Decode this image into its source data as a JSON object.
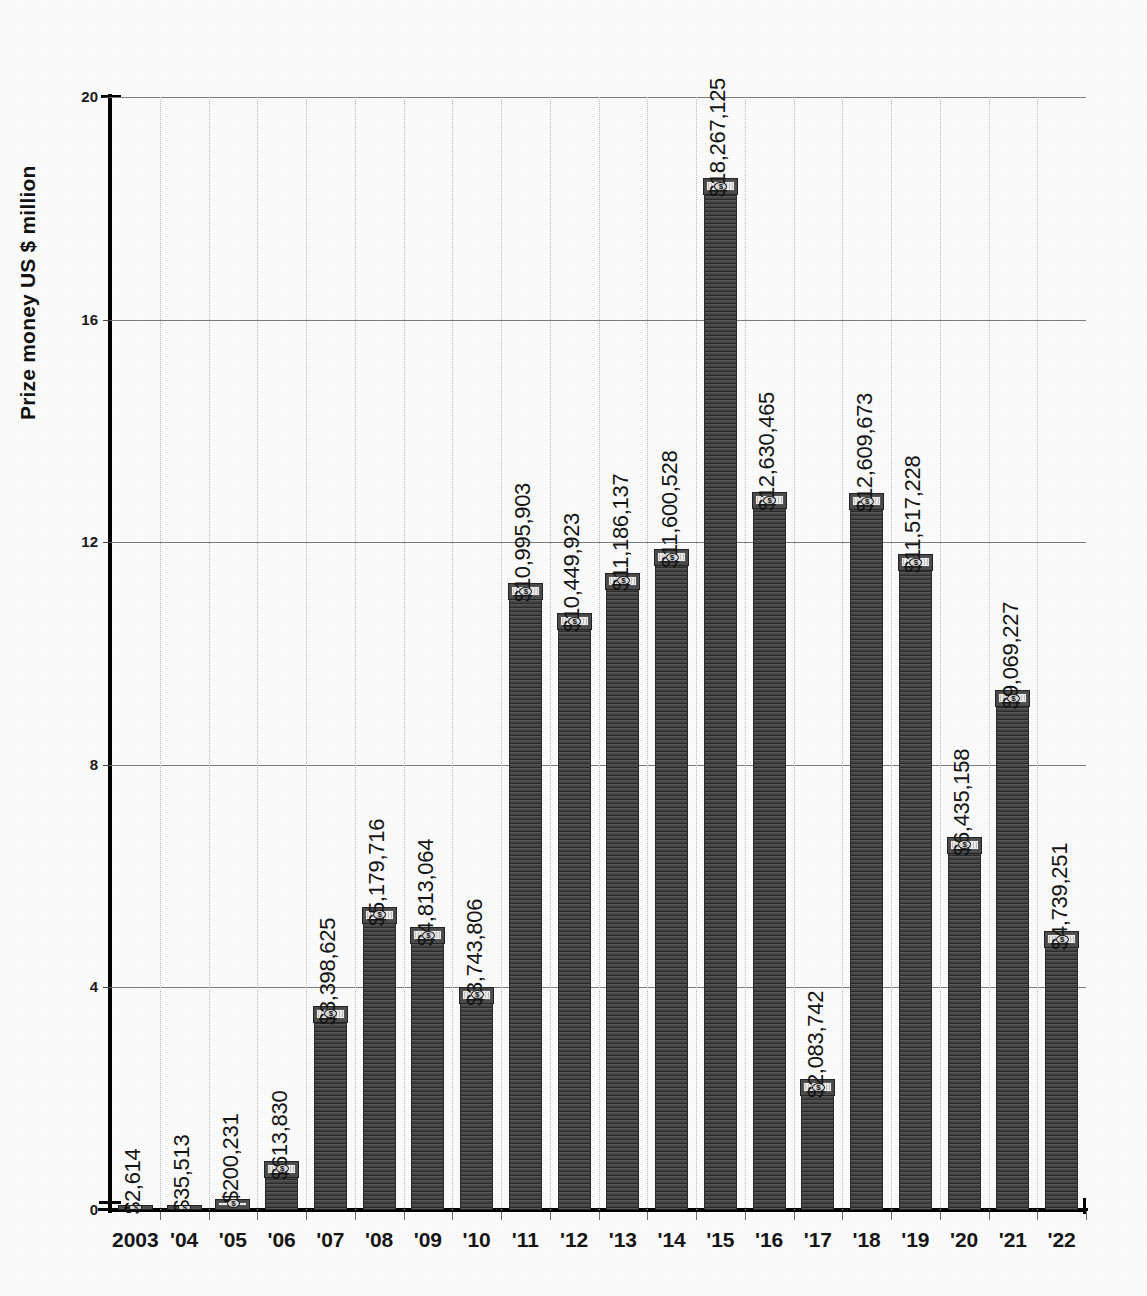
{
  "chart_data": {
    "type": "bar",
    "title": "",
    "subtitle": "",
    "xlabel": "",
    "ylabel": "Prize money US $ million",
    "ylim": [
      0,
      20
    ],
    "yticks": [
      0,
      4,
      8,
      12,
      16,
      20
    ],
    "ytick_labels": [
      "0",
      "4",
      "8",
      "12",
      "16",
      "20"
    ],
    "grid": "horizontal solid gridlines at each y tick; faint dotted vertical gridlines between categories",
    "legend": "none",
    "bar_color": "#3a3a3a",
    "bar_cap_style": "banknote-graphic",
    "label_orientation": "vertical (rotated 90 degrees, reading bottom-to-top)",
    "value_unit": "US dollars",
    "axis_unit": "US $ million",
    "categories": [
      "2003",
      "'04",
      "'05",
      "'06",
      "'07",
      "'08",
      "'09",
      "'10",
      "'11",
      "'12",
      "'13",
      "'14",
      "'15",
      "'16",
      "'17",
      "'18",
      "'19",
      "'20",
      "'21",
      "'22"
    ],
    "values": [
      0.002614,
      0.035513,
      0.200231,
      0.61383,
      3.398625,
      5.179716,
      4.813064,
      3.743806,
      10.995903,
      10.449923,
      11.186137,
      11.600528,
      18.267125,
      12.630465,
      2.083742,
      12.609673,
      11.517228,
      6.435158,
      9.069227,
      4.739251
    ],
    "data_labels": [
      "$2,614",
      "$35,513",
      "$200,231",
      "$613,830",
      "$3,398,625",
      "$5,179,716",
      "$4,813,064",
      "$3,743,806",
      "$10,995,903",
      "$10,449,923",
      "$11,186,137",
      "$11,600,528",
      "$18,267,125",
      "$12,630,465",
      "$2,083,742",
      "$12,609,673",
      "$11,517,228",
      "$6,435,158",
      "$9,069,227",
      "$4,739,251"
    ],
    "raw_values": [
      2614,
      35513,
      200231,
      613830,
      3398625,
      5179716,
      4813064,
      3743806,
      10995903,
      10449923,
      11186137,
      11600528,
      18267125,
      12630465,
      2083742,
      12609673,
      11517228,
      6435158,
      9069227,
      4739251
    ]
  },
  "axes": {
    "y_title": "Prize money US $ million"
  }
}
